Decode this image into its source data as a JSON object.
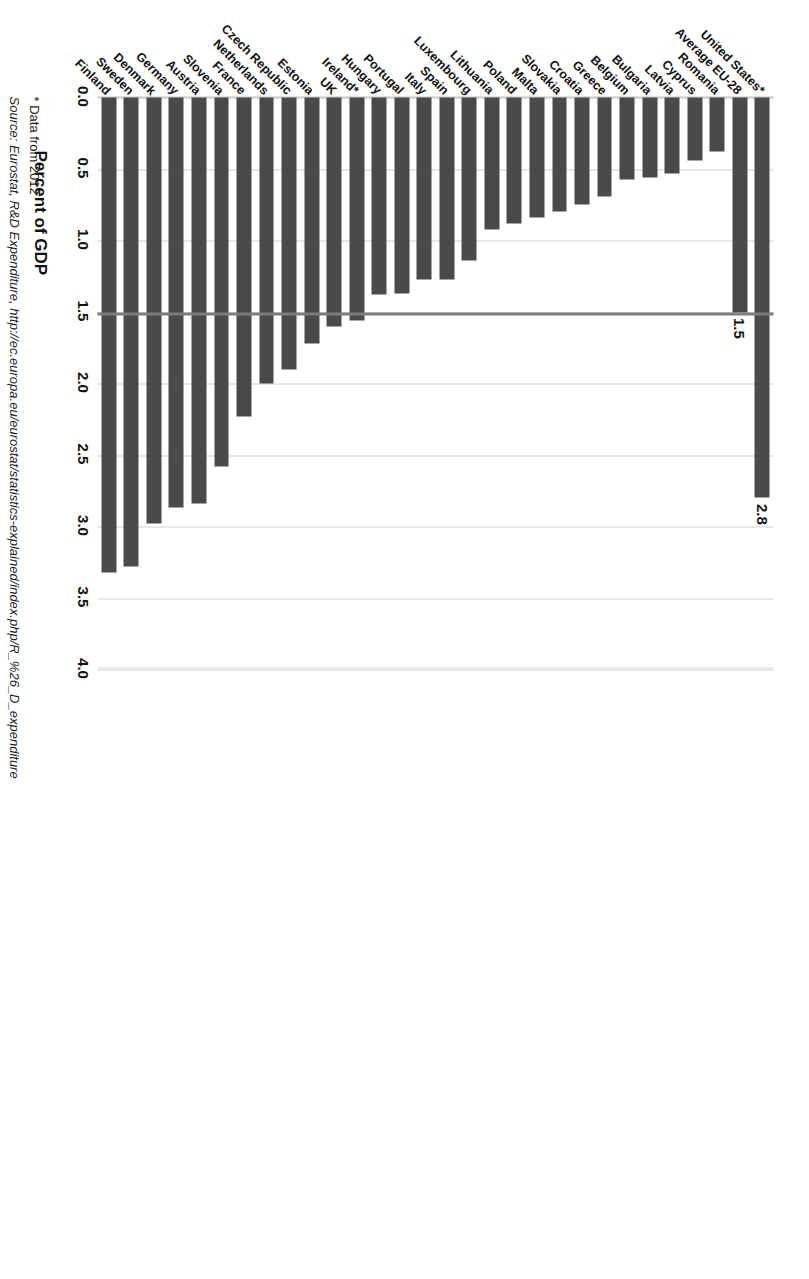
{
  "chart_data": {
    "type": "bar",
    "orientation": "horizontal",
    "title": "",
    "xlabel": "Percent of GDP",
    "ylabel": "",
    "xlim": [
      0.0,
      4.0
    ],
    "xticks": [
      "0.0",
      "0.5",
      "1.0",
      "1.5",
      "2.0",
      "2.5",
      "3.0",
      "3.5",
      "4.0"
    ],
    "xtick_values": [
      0.0,
      0.5,
      1.0,
      1.5,
      2.0,
      2.5,
      3.0,
      3.5,
      4.0
    ],
    "grid": true,
    "legend": false,
    "bar_color": "#4a4a4a",
    "reference_line": {
      "value": 1.5,
      "color": "#7d7d7d",
      "label": "Average EU-28"
    },
    "categories": [
      "Finland",
      "Sweden",
      "Denmark",
      "Germany",
      "Austria",
      "Slovenia",
      "France",
      "Netherlands",
      "Czech Republic",
      "Estonia",
      "UK",
      "Ireland*",
      "Hungary",
      "Portugal",
      "Italy",
      "Spain",
      "Luxembourg",
      "Lithuania",
      "Poland",
      "Malta",
      "Slovakia",
      "Croatia",
      "Greece",
      "Belgium",
      "Bulgaria",
      "Latvia",
      "Cyprus",
      "Romania",
      "Average EU-28",
      "United States*"
    ],
    "values": [
      3.32,
      3.28,
      2.98,
      2.87,
      2.84,
      2.58,
      2.23,
      2.0,
      1.9,
      1.72,
      1.6,
      1.56,
      1.38,
      1.37,
      1.27,
      1.27,
      1.14,
      0.92,
      0.88,
      0.84,
      0.8,
      0.75,
      0.69,
      0.57,
      0.56,
      0.53,
      0.44,
      0.38,
      1.5,
      2.8
    ],
    "data_labels": {
      "Average EU-28": "1.5",
      "United States*": "2.8"
    },
    "footnotes": [
      "* Data from 2012",
      "Source: Eurostat, R&D Expenditure, http://ec.europa.eu/eurostat/statistics-explained/index.php/R_%26_D_expenditure"
    ]
  },
  "axis_title": "Percent of GDP",
  "footnote_marker": "* Data from 2012",
  "source_line": "Source: Eurostat, R&D Expenditure, http://ec.europa.eu/eurostat/statistics-explained/index.php/R_%26_D_expenditure"
}
